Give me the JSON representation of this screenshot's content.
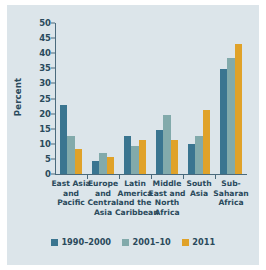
{
  "chart_data": {
    "type": "bar",
    "title": "",
    "xlabel": "",
    "ylabel": "Percent",
    "ylim": [
      0,
      50
    ],
    "yticks": [
      0,
      5,
      10,
      15,
      20,
      25,
      30,
      35,
      40,
      45,
      50
    ],
    "grid": false,
    "legend_position": "bottom",
    "categories": [
      "East Asia and Pacific",
      "Europe and Central Asia",
      "Latin America and the Caribbean",
      "Middle East and North Africa",
      "South Asia",
      "Sub-Saharan Africa"
    ],
    "category_lines": [
      [
        "East Asia",
        "and",
        "Pacific"
      ],
      [
        "Europe",
        "and",
        "Central",
        "Asia"
      ],
      [
        "Latin",
        "America",
        "and the",
        "Caribbean"
      ],
      [
        "Middle",
        "East and",
        "North",
        "Africa"
      ],
      [
        "South",
        "Asia"
      ],
      [
        "Sub-",
        "Saharan",
        "Africa"
      ]
    ],
    "series": [
      {
        "name": "1990–2000",
        "color": "#3a7590",
        "values": [
          23.0,
          4.2,
          12.7,
          14.7,
          10.1,
          34.7
        ]
      },
      {
        "name": "2001–10",
        "color": "#82aaab",
        "values": [
          12.6,
          6.8,
          9.4,
          19.7,
          12.7,
          38.5
        ]
      },
      {
        "name": "2011",
        "color": "#e0a229",
        "values": [
          8.2,
          5.5,
          11.4,
          11.4,
          21.2,
          43.0
        ]
      }
    ]
  },
  "colors": {
    "background": "#dce5ea",
    "axis": "#4a6a7c",
    "text": "#2a4a5c",
    "series_1990_2000": "#3a7590",
    "series_2001_10": "#82aaab",
    "series_2011": "#e0a229"
  }
}
